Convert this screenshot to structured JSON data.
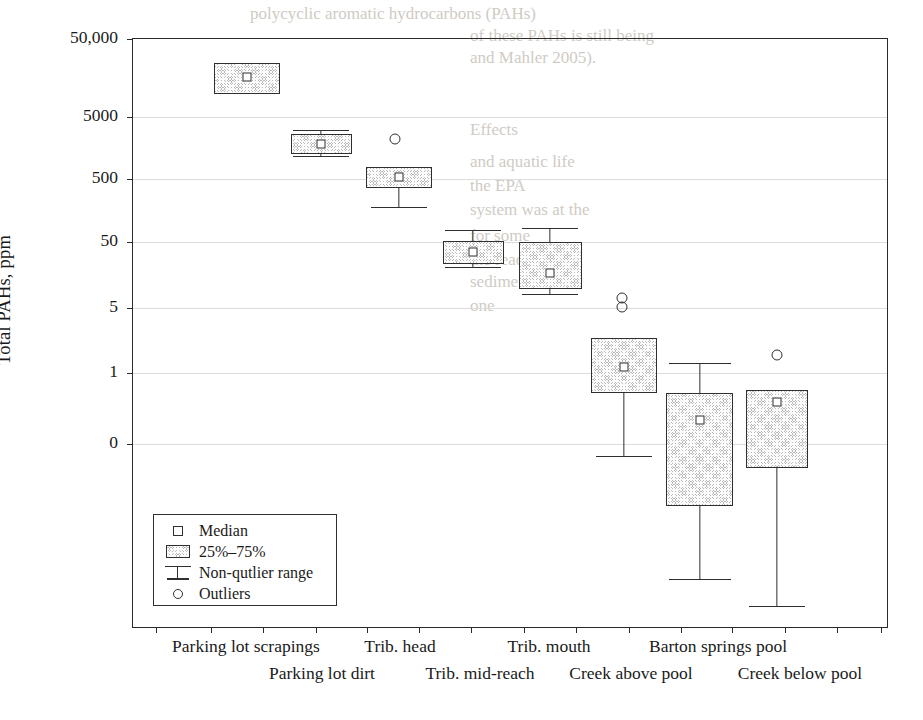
{
  "chart_data": {
    "type": "box",
    "title": "",
    "xlabel": "",
    "ylabel": "Total PAHs, ppm",
    "y_scale": "log-like (broken at 0)",
    "ylim": [
      0,
      50000
    ],
    "y_ticks": [
      "50,000",
      "5000",
      "500",
      "50",
      "5",
      "1",
      "0"
    ],
    "grid": true,
    "legend_position": "inside-lower-left",
    "categories": [
      "Parking lot scrapings",
      "Parking lot dirt",
      "Trib. head",
      "Trib. mid-reach",
      "Trib. mouth",
      "Creek above pool",
      "Barton springs pool",
      "Creek below pool"
    ],
    "boxes": [
      {
        "category": "Parking lot scrapings",
        "q1": 13000,
        "q3": 30000,
        "median": 20000,
        "whisker_low": null,
        "whisker_high": null,
        "outliers": []
      },
      {
        "category": "Parking lot dirt",
        "q1": 2700,
        "q3": 4300,
        "median": 3500,
        "whisker_low": 2700,
        "whisker_high": 4900,
        "outliers": []
      },
      {
        "category": "Trib. head",
        "q1": 1000,
        "q3": 1700,
        "median": 1350,
        "whisker_low": 620,
        "whisker_high": 1700,
        "outliers": [
          4400
        ]
      },
      {
        "category": "Trib. mid-reach",
        "q1": 210,
        "q3": 330,
        "median": 270,
        "whisker_low": 195,
        "whisker_high": 400,
        "outliers": []
      },
      {
        "category": "Trib. mouth",
        "q1": 110,
        "q3": 330,
        "median": 190,
        "whisker_low": 95,
        "whisker_high": 400,
        "outliers": []
      },
      {
        "category": "Creek above pool",
        "q1": 7.5,
        "q3": 22,
        "median": 14,
        "whisker_low": 2.2,
        "whisker_high": 22,
        "outliers": [
          62,
          55
        ]
      },
      {
        "category": "Barton springs pool",
        "q1": 0.85,
        "q3": 6.2,
        "median": 4.0,
        "whisker_low": 0.08,
        "whisker_high": 19,
        "outliers": []
      },
      {
        "category": "Creek below pool",
        "q1": 1.6,
        "q3": 6.2,
        "median": 5.2,
        "whisker_low": -0.4,
        "whisker_high": 6.2,
        "outliers": [
          16
        ]
      }
    ],
    "legend": [
      {
        "key": "median-square",
        "label": "Median"
      },
      {
        "key": "quartile-box",
        "label": "25%–75%"
      },
      {
        "key": "range-bar",
        "label": "Non-qutlier range"
      },
      {
        "key": "outlier-circle",
        "label": "Outliers"
      }
    ]
  },
  "axis": {
    "y_title": "Total PAHs, ppm",
    "y_ticks": [
      {
        "label": "50,000",
        "y": 38
      },
      {
        "label": "5000",
        "y": 116
      },
      {
        "label": "500",
        "y": 178
      },
      {
        "label": "50",
        "y": 241
      },
      {
        "label": "5",
        "y": 307
      },
      {
        "label": "1",
        "y": 372
      },
      {
        "label": "0",
        "y": 443
      }
    ],
    "x_ticks_px": [
      155,
      210,
      262,
      315,
      366,
      418,
      470,
      523,
      575,
      628,
      680,
      731,
      784,
      836,
      880
    ],
    "x_labels": [
      {
        "text": "Parking lot scrapings",
        "x": 246,
        "row": 0
      },
      {
        "text": "Parking lot dirt",
        "x": 322,
        "row": 1
      },
      {
        "text": "Trib. head",
        "x": 400,
        "row": 0
      },
      {
        "text": "Trib. mid-reach",
        "x": 480,
        "row": 1
      },
      {
        "text": "Trib. mouth",
        "x": 549,
        "row": 0
      },
      {
        "text": "Creek above pool",
        "x": 631,
        "row": 1
      },
      {
        "text": "Barton springs pool",
        "x": 718,
        "row": 0
      },
      {
        "text": "Creek below pool",
        "x": 800,
        "row": 1
      }
    ]
  },
  "render": {
    "boxes_px": [
      {
        "name": "parking-lot-scrapings",
        "left": 213,
        "width": 66,
        "top": 62,
        "height": 31,
        "median_x": 246,
        "median_y": 76,
        "whisker_x": 246,
        "w_top": null,
        "w_bot": null,
        "cap_w": 0,
        "outliers": []
      },
      {
        "name": "parking-lot-dirt",
        "left": 290,
        "width": 61,
        "top": 133,
        "height": 20,
        "median_x": 320,
        "median_y": 143,
        "whisker_x": 320,
        "w_top": 129,
        "w_bot": 155,
        "cap_w": 56,
        "outliers": []
      },
      {
        "name": "trib-head",
        "left": 365,
        "width": 66,
        "top": 166,
        "height": 21,
        "median_x": 398,
        "median_y": 176,
        "whisker_x": 398,
        "w_top": 166,
        "w_bot": 206,
        "cap_w": 56,
        "outliers": [
          {
            "x": 394,
            "y": 138
          }
        ]
      },
      {
        "name": "trib-mid-reach",
        "left": 442,
        "width": 61,
        "top": 240,
        "height": 23,
        "median_x": 472,
        "median_y": 251,
        "whisker_x": 472,
        "w_top": 229,
        "w_bot": 266,
        "cap_w": 56,
        "outliers": []
      },
      {
        "name": "trib-mouth",
        "left": 518,
        "width": 63,
        "top": 241,
        "height": 47,
        "median_x": 549,
        "median_y": 272,
        "whisker_x": 549,
        "w_top": 227,
        "w_bot": 293,
        "cap_w": 56,
        "outliers": []
      },
      {
        "name": "creek-above-pool",
        "left": 590,
        "width": 66,
        "top": 337,
        "height": 55,
        "median_x": 623,
        "median_y": 366,
        "whisker_x": 623,
        "w_top": 337,
        "w_bot": 455,
        "cap_w": 56,
        "outliers": [
          {
            "x": 621,
            "y": 297
          },
          {
            "x": 621,
            "y": 306
          }
        ]
      },
      {
        "name": "barton-springs-pool",
        "left": 665,
        "width": 67,
        "top": 392,
        "height": 113,
        "median_x": 699,
        "median_y": 419,
        "whisker_x": 699,
        "w_top": 362,
        "w_bot": 578,
        "cap_w": 62,
        "outliers": []
      },
      {
        "name": "creek-below-pool",
        "left": 745,
        "width": 62,
        "top": 389,
        "height": 78,
        "median_x": 776,
        "median_y": 401,
        "whisker_x": 776,
        "w_top": 389,
        "w_bot": 605,
        "cap_w": 56,
        "outliers": [
          {
            "x": 776,
            "y": 354
          }
        ]
      }
    ]
  },
  "bleed_text": [
    {
      "text": "polycyclic aromatic hydrocarbons (PAHs)",
      "x": 250,
      "y": 4,
      "size": 17
    },
    {
      "text": "of these PAHs is still being",
      "x": 470,
      "y": 26,
      "size": 17
    },
    {
      "text": "and Mahler 2005).",
      "x": 470,
      "y": 48,
      "size": 17
    },
    {
      "text": "Effects",
      "x": 470,
      "y": 120,
      "size": 17
    },
    {
      "text": "and aquatic life",
      "x": 470,
      "y": 152,
      "size": 17
    },
    {
      "text": "the EPA",
      "x": 470,
      "y": 176,
      "size": 17
    },
    {
      "text": "system was at the",
      "x": 470,
      "y": 200,
      "size": 17
    },
    {
      "text": "for some",
      "x": 470,
      "y": 226,
      "size": 17
    },
    {
      "text": "the reach",
      "x": 470,
      "y": 250,
      "size": 17
    },
    {
      "text": "sediment",
      "x": 470,
      "y": 272,
      "size": 17
    },
    {
      "text": "one",
      "x": 470,
      "y": 296,
      "size": 17
    }
  ]
}
